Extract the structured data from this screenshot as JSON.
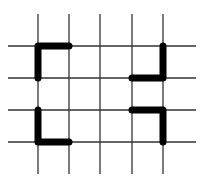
{
  "diagram": {
    "type": "grid-with-highlighted-corners",
    "background": "#ffffff",
    "grid_color": "#333333",
    "highlight_color": "#000000",
    "vertical_lines_x": [
      38,
      69,
      100,
      132,
      163
    ],
    "horizontal_lines_y": [
      46,
      78,
      110,
      142
    ],
    "extent": {
      "x_min": 8,
      "x_max": 196,
      "y_min": 14,
      "y_max": 174
    },
    "shapes": [
      {
        "name": "top-left-corner",
        "points": [
          [
            38,
            78
          ],
          [
            38,
            46
          ],
          [
            69,
            46
          ]
        ]
      },
      {
        "name": "top-right-corner",
        "points": [
          [
            132,
            78
          ],
          [
            163,
            78
          ],
          [
            163,
            46
          ]
        ]
      },
      {
        "name": "bottom-left-corner",
        "points": [
          [
            38,
            110
          ],
          [
            38,
            142
          ],
          [
            69,
            142
          ]
        ]
      },
      {
        "name": "bottom-right-corner",
        "points": [
          [
            132,
            110
          ],
          [
            163,
            110
          ],
          [
            163,
            142
          ]
        ]
      }
    ]
  }
}
